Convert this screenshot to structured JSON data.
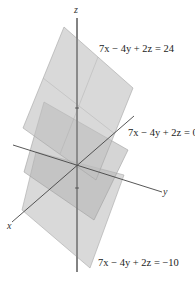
{
  "figure": {
    "axes": {
      "x_label": "x",
      "y_label": "y",
      "z_label": "z"
    },
    "planes": [
      {
        "name": "plane-top",
        "equation": "7x − 4y + 2z = 24"
      },
      {
        "name": "plane-middle",
        "equation": "7x − 4y + 2z = 0"
      },
      {
        "name": "plane-bottom",
        "equation": "7x − 4y + 2z = −10"
      }
    ],
    "colors": {
      "plane_fill": "#b8b8b8",
      "plane_edge": "#9a9a9a",
      "axis": "#444444"
    }
  }
}
